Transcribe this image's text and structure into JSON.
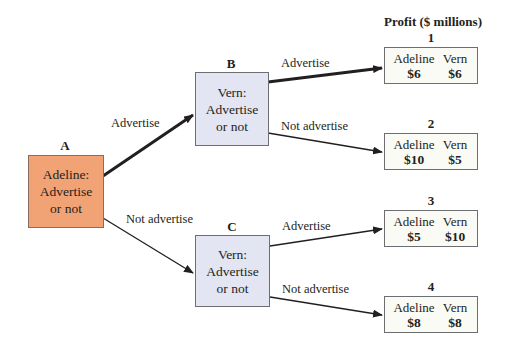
{
  "header": {
    "title": "Profit ($ millions)"
  },
  "nodes": {
    "A": {
      "label": "A",
      "player": "Adeline:",
      "line2": "Advertise",
      "line3": "or not",
      "color": "#f2a375"
    },
    "B": {
      "label": "B",
      "player": "Vern:",
      "line2": "Advertise",
      "line3": "or not",
      "color": "#e4e5f2"
    },
    "C": {
      "label": "C",
      "player": "Vern:",
      "line2": "Advertise",
      "line3": "or not",
      "color": "#e4e5f2"
    }
  },
  "edges": {
    "A_B": "Advertise",
    "A_C": "Not advertise",
    "B_1": "Advertise",
    "B_2": "Not advertise",
    "C_3": "Advertise",
    "C_4": "Not advertise"
  },
  "outcomes": [
    {
      "num": "1",
      "p1_name": "Adeline",
      "p1_value": "$6",
      "p2_name": "Vern",
      "p2_value": "$6"
    },
    {
      "num": "2",
      "p1_name": "Adeline",
      "p1_value": "$10",
      "p2_name": "Vern",
      "p2_value": "$5"
    },
    {
      "num": "3",
      "p1_name": "Adeline",
      "p1_value": "$5",
      "p2_name": "Vern",
      "p2_value": "$10"
    },
    {
      "num": "4",
      "p1_name": "Adeline",
      "p1_value": "$8",
      "p2_name": "Vern",
      "p2_value": "$8"
    }
  ]
}
